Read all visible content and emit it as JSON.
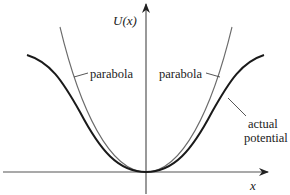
{
  "diagram": {
    "title": "",
    "axes": {
      "y_label": "U(x)",
      "x_label": "x"
    },
    "curves": [
      {
        "name": "actual potential",
        "style": "thick dark"
      },
      {
        "name": "parabola",
        "style": "thin gray"
      }
    ],
    "annotations": {
      "parabola_left": "parabola",
      "parabola_right": "parabola",
      "actual_line1": "actual",
      "actual_line2": "potential"
    },
    "colors": {
      "actual": "#1a1a1a",
      "parabola": "#6b6b6b",
      "axis": "#444444"
    }
  }
}
